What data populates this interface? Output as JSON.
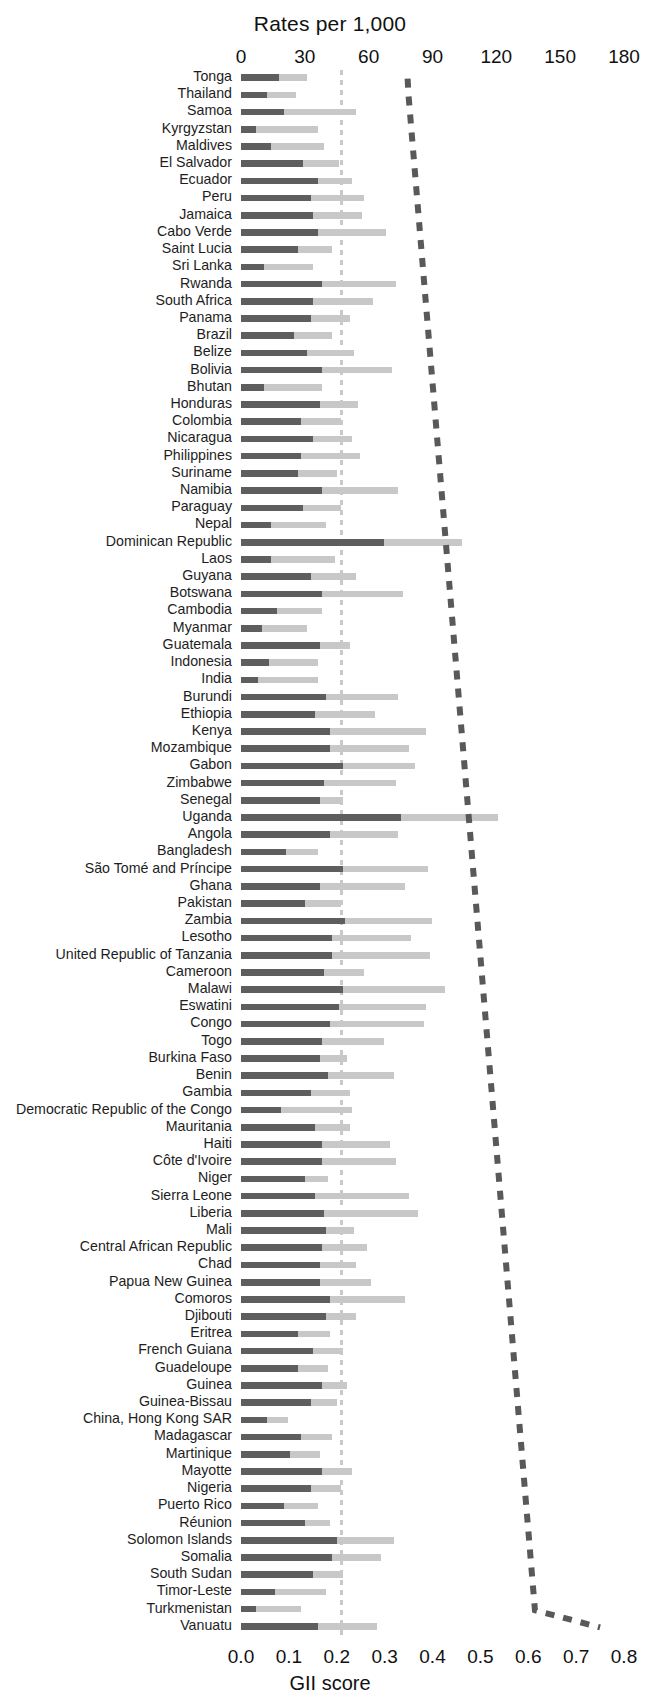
{
  "chart_data": {
    "type": "bar",
    "title": "",
    "xlabel": "Rates per 1,000",
    "xlabel_secondary": "GII score",
    "ylabel": "",
    "orientation": "horizontal",
    "stacked": true,
    "grid": false,
    "legend_position": "none",
    "top_axis": {
      "label": "Rates per 1,000",
      "ticks": [
        0,
        30,
        60,
        90,
        120,
        150,
        180
      ],
      "tick_labels": [
        "0",
        "30",
        "60",
        "90",
        "120",
        "150",
        "180"
      ],
      "xlim": [
        0,
        180
      ]
    },
    "bottom_axis": {
      "label": "GII score",
      "ticks": [
        0.0,
        0.1,
        0.2,
        0.3,
        0.4,
        0.5,
        0.6,
        0.7,
        0.8
      ],
      "tick_labels": [
        "0.0",
        "0.1",
        "0.2",
        "0.3",
        "0.4",
        "0.5",
        "0.6",
        "0.7",
        "0.8"
      ],
      "xlim": [
        0.0,
        0.8
      ]
    },
    "reference_line": {
      "value": 47,
      "axis": "top",
      "style": "dashed",
      "color": "#c9c9c9"
    },
    "gii_series": {
      "name": "GII score",
      "style": "dashed",
      "color": "#595959",
      "axis": "bottom"
    },
    "series": [
      {
        "name": "Rate segment 1",
        "color": "#5e5e5e"
      },
      {
        "name": "Rate segment 2",
        "color": "#c8c8c8"
      }
    ],
    "categories": [
      "Tonga",
      "Thailand",
      "Samoa",
      "Kyrgyzstan",
      "Maldives",
      "El Salvador",
      "Ecuador",
      "Peru",
      "Jamaica",
      "Cabo Verde",
      "Saint Lucia",
      "Sri Lanka",
      "Rwanda",
      "South Africa",
      "Panama",
      "Brazil",
      "Belize",
      "Bolivia",
      "Bhutan",
      "Honduras",
      "Colombia",
      "Nicaragua",
      "Philippines",
      "Suriname",
      "Namibia",
      "Paraguay",
      "Nepal",
      "Dominican Republic",
      "Laos",
      "Guyana",
      "Botswana",
      "Cambodia",
      "Myanmar",
      "Guatemala",
      "Indonesia",
      "India",
      "Burundi",
      "Ethiopia",
      "Kenya",
      "Mozambique",
      "Gabon",
      "Zimbabwe",
      "Senegal",
      "Uganda",
      "Angola",
      "Bangladesh",
      "São Tomé and Príncipe",
      "Ghana",
      "Pakistan",
      "Zambia",
      "Lesotho",
      "United Republic of Tanzania",
      "Cameroon",
      "Malawi",
      "Eswatini",
      "Congo",
      "Togo",
      "Burkina Faso",
      "Benin",
      "Gambia",
      "Democratic Republic of the Congo",
      "Mauritania",
      "Haiti",
      "Côte d'Ivoire",
      "Niger",
      "Sierra Leone",
      "Liberia",
      "Mali",
      "Central African Republic",
      "Chad",
      "Papua New Guinea",
      "Comoros",
      "Djibouti",
      "Eritrea",
      "French Guiana",
      "Guadeloupe",
      "Guinea",
      "Guinea-Bissau",
      "China, Hong Kong SAR",
      "Madagascar",
      "Martinique",
      "Mayotte",
      "Nigeria",
      "Puerto Rico",
      "Réunion",
      "Solomon Islands",
      "Somalia",
      "South Sudan",
      "Timor-Leste",
      "Turkmenistan",
      "Vanuatu"
    ],
    "rows": [
      {
        "country": "Tonga",
        "seg1": 18,
        "seg2": 31,
        "gii": 0.348
      },
      {
        "country": "Thailand",
        "seg1": 12,
        "seg2": 26,
        "gii": 0.35
      },
      {
        "country": "Samoa",
        "seg1": 20,
        "seg2": 54,
        "gii": 0.353
      },
      {
        "country": "Kyrgyzstan",
        "seg1": 7,
        "seg2": 36,
        "gii": 0.356
      },
      {
        "country": "Maldives",
        "seg1": 14,
        "seg2": 39,
        "gii": 0.359
      },
      {
        "country": "El Salvador",
        "seg1": 29,
        "seg2": 46,
        "gii": 0.362
      },
      {
        "country": "Ecuador",
        "seg1": 36,
        "seg2": 52,
        "gii": 0.365
      },
      {
        "country": "Peru",
        "seg1": 33,
        "seg2": 58,
        "gii": 0.368
      },
      {
        "country": "Jamaica",
        "seg1": 34,
        "seg2": 57,
        "gii": 0.371
      },
      {
        "country": "Cabo Verde",
        "seg1": 36,
        "seg2": 68,
        "gii": 0.374
      },
      {
        "country": "Saint Lucia",
        "seg1": 27,
        "seg2": 43,
        "gii": 0.377
      },
      {
        "country": "Sri Lanka",
        "seg1": 11,
        "seg2": 34,
        "gii": 0.38
      },
      {
        "country": "Rwanda",
        "seg1": 38,
        "seg2": 73,
        "gii": 0.383
      },
      {
        "country": "South Africa",
        "seg1": 34,
        "seg2": 62,
        "gii": 0.386
      },
      {
        "country": "Panama",
        "seg1": 33,
        "seg2": 51,
        "gii": 0.389
      },
      {
        "country": "Brazil",
        "seg1": 25,
        "seg2": 43,
        "gii": 0.392
      },
      {
        "country": "Belize",
        "seg1": 31,
        "seg2": 53,
        "gii": 0.395
      },
      {
        "country": "Bolivia",
        "seg1": 38,
        "seg2": 71,
        "gii": 0.398
      },
      {
        "country": "Bhutan",
        "seg1": 11,
        "seg2": 38,
        "gii": 0.401
      },
      {
        "country": "Honduras",
        "seg1": 37,
        "seg2": 55,
        "gii": 0.404
      },
      {
        "country": "Colombia",
        "seg1": 28,
        "seg2": 47,
        "gii": 0.407
      },
      {
        "country": "Nicaragua",
        "seg1": 34,
        "seg2": 52,
        "gii": 0.41
      },
      {
        "country": "Philippines",
        "seg1": 28,
        "seg2": 56,
        "gii": 0.413
      },
      {
        "country": "Suriname",
        "seg1": 27,
        "seg2": 45,
        "gii": 0.416
      },
      {
        "country": "Namibia",
        "seg1": 38,
        "seg2": 74,
        "gii": 0.419
      },
      {
        "country": "Paraguay",
        "seg1": 29,
        "seg2": 47,
        "gii": 0.422
      },
      {
        "country": "Nepal",
        "seg1": 14,
        "seg2": 40,
        "gii": 0.425
      },
      {
        "country": "Dominican Republic",
        "seg1": 67,
        "seg2": 104,
        "gii": 0.428
      },
      {
        "country": "Laos",
        "seg1": 14,
        "seg2": 44,
        "gii": 0.431
      },
      {
        "country": "Guyana",
        "seg1": 33,
        "seg2": 54,
        "gii": 0.434
      },
      {
        "country": "Botswana",
        "seg1": 38,
        "seg2": 76,
        "gii": 0.437
      },
      {
        "country": "Cambodia",
        "seg1": 17,
        "seg2": 38,
        "gii": 0.44
      },
      {
        "country": "Myanmar",
        "seg1": 10,
        "seg2": 31,
        "gii": 0.443
      },
      {
        "country": "Guatemala",
        "seg1": 37,
        "seg2": 51,
        "gii": 0.446
      },
      {
        "country": "Indonesia",
        "seg1": 13,
        "seg2": 36,
        "gii": 0.449
      },
      {
        "country": "India",
        "seg1": 8,
        "seg2": 36,
        "gii": 0.452
      },
      {
        "country": "Burundi",
        "seg1": 40,
        "seg2": 74,
        "gii": 0.455
      },
      {
        "country": "Ethiopia",
        "seg1": 35,
        "seg2": 63,
        "gii": 0.458
      },
      {
        "country": "Kenya",
        "seg1": 42,
        "seg2": 87,
        "gii": 0.461
      },
      {
        "country": "Mozambique",
        "seg1": 42,
        "seg2": 79,
        "gii": 0.464
      },
      {
        "country": "Gabon",
        "seg1": 48,
        "seg2": 82,
        "gii": 0.467
      },
      {
        "country": "Zimbabwe",
        "seg1": 39,
        "seg2": 73,
        "gii": 0.47
      },
      {
        "country": "Senegal",
        "seg1": 37,
        "seg2": 48,
        "gii": 0.473
      },
      {
        "country": "Uganda",
        "seg1": 75,
        "seg2": 121,
        "gii": 0.476
      },
      {
        "country": "Angola",
        "seg1": 42,
        "seg2": 74,
        "gii": 0.479
      },
      {
        "country": "Bangladesh",
        "seg1": 21,
        "seg2": 36,
        "gii": 0.482
      },
      {
        "country": "São Tomé and Príncipe",
        "seg1": 48,
        "seg2": 88,
        "gii": 0.485
      },
      {
        "country": "Ghana",
        "seg1": 37,
        "seg2": 77,
        "gii": 0.488
      },
      {
        "country": "Pakistan",
        "seg1": 30,
        "seg2": 47,
        "gii": 0.491
      },
      {
        "country": "Zambia",
        "seg1": 49,
        "seg2": 90,
        "gii": 0.494
      },
      {
        "country": "Lesotho",
        "seg1": 43,
        "seg2": 80,
        "gii": 0.497
      },
      {
        "country": "United Republic of Tanzania",
        "seg1": 43,
        "seg2": 89,
        "gii": 0.5
      },
      {
        "country": "Cameroon",
        "seg1": 39,
        "seg2": 58,
        "gii": 0.503
      },
      {
        "country": "Malawi",
        "seg1": 48,
        "seg2": 96,
        "gii": 0.506
      },
      {
        "country": "Eswatini",
        "seg1": 46,
        "seg2": 87,
        "gii": 0.509
      },
      {
        "country": "Congo",
        "seg1": 42,
        "seg2": 86,
        "gii": 0.512
      },
      {
        "country": "Togo",
        "seg1": 38,
        "seg2": 67,
        "gii": 0.515
      },
      {
        "country": "Burkina Faso",
        "seg1": 37,
        "seg2": 50,
        "gii": 0.518
      },
      {
        "country": "Benin",
        "seg1": 41,
        "seg2": 72,
        "gii": 0.521
      },
      {
        "country": "Gambia",
        "seg1": 33,
        "seg2": 51,
        "gii": 0.524
      },
      {
        "country": "Democratic Republic of the Congo",
        "seg1": 19,
        "seg2": 52,
        "gii": 0.527
      },
      {
        "country": "Mauritania",
        "seg1": 35,
        "seg2": 51,
        "gii": 0.53
      },
      {
        "country": "Haiti",
        "seg1": 38,
        "seg2": 70,
        "gii": 0.533
      },
      {
        "country": "Côte d'Ivoire",
        "seg1": 38,
        "seg2": 73,
        "gii": 0.536
      },
      {
        "country": "Niger",
        "seg1": 30,
        "seg2": 41,
        "gii": 0.539
      },
      {
        "country": "Sierra Leone",
        "seg1": 35,
        "seg2": 79,
        "gii": 0.542
      },
      {
        "country": "Liberia",
        "seg1": 39,
        "seg2": 83,
        "gii": 0.545
      },
      {
        "country": "Mali",
        "seg1": 40,
        "seg2": 53,
        "gii": 0.548
      },
      {
        "country": "Central African Republic",
        "seg1": 38,
        "seg2": 59,
        "gii": 0.551
      },
      {
        "country": "Chad",
        "seg1": 37,
        "seg2": 54,
        "gii": 0.554
      },
      {
        "country": "Papua New Guinea",
        "seg1": 37,
        "seg2": 61,
        "gii": 0.557
      },
      {
        "country": "Comoros",
        "seg1": 42,
        "seg2": 77,
        "gii": 0.56
      },
      {
        "country": "Djibouti",
        "seg1": 40,
        "seg2": 54,
        "gii": 0.563
      },
      {
        "country": "Eritrea",
        "seg1": 27,
        "seg2": 42,
        "gii": 0.566
      },
      {
        "country": "French Guiana",
        "seg1": 34,
        "seg2": 48,
        "gii": 0.569
      },
      {
        "country": "Guadeloupe",
        "seg1": 27,
        "seg2": 41,
        "gii": 0.572
      },
      {
        "country": "Guinea",
        "seg1": 38,
        "seg2": 50,
        "gii": 0.575
      },
      {
        "country": "Guinea-Bissau",
        "seg1": 33,
        "seg2": 45,
        "gii": 0.578
      },
      {
        "country": "China, Hong Kong SAR",
        "seg1": 12,
        "seg2": 22,
        "gii": 0.581
      },
      {
        "country": "Madagascar",
        "seg1": 28,
        "seg2": 43,
        "gii": 0.584
      },
      {
        "country": "Martinique",
        "seg1": 23,
        "seg2": 37,
        "gii": 0.587
      },
      {
        "country": "Mayotte",
        "seg1": 38,
        "seg2": 52,
        "gii": 0.59
      },
      {
        "country": "Nigeria",
        "seg1": 33,
        "seg2": 47,
        "gii": 0.593
      },
      {
        "country": "Puerto Rico",
        "seg1": 20,
        "seg2": 36,
        "gii": 0.596
      },
      {
        "country": "Réunion",
        "seg1": 30,
        "seg2": 42,
        "gii": 0.599
      },
      {
        "country": "Solomon Islands",
        "seg1": 45,
        "seg2": 72,
        "gii": 0.602
      },
      {
        "country": "Somalia",
        "seg1": 43,
        "seg2": 66,
        "gii": 0.605
      },
      {
        "country": "South Sudan",
        "seg1": 34,
        "seg2": 48,
        "gii": 0.608
      },
      {
        "country": "Timor-Leste",
        "seg1": 16,
        "seg2": 40,
        "gii": 0.611
      },
      {
        "country": "Turkmenistan",
        "seg1": 7,
        "seg2": 28,
        "gii": 0.614
      },
      {
        "country": "Vanuatu",
        "seg1": 36,
        "seg2": 64,
        "gii": 0.75
      }
    ]
  }
}
